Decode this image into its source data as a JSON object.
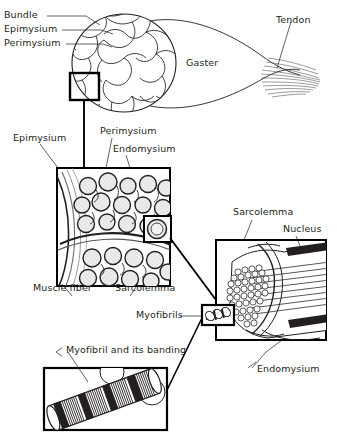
{
  "figure": {
    "domain": "anatomical-diagram",
    "stroke_color": "#231f20",
    "background_color": "#ffffff",
    "text_color": "#231f20"
  },
  "labels": {
    "bundle": "Bundle",
    "epimysium_top": "Epimysium",
    "perimysium_top": "Perimysium",
    "gaster": "Gaster",
    "tendon": "Tendon",
    "epimysium_mid": "Epimysium",
    "perimysium_mid": "Perimysium",
    "endomysium_mid": "Endomysium",
    "muscle_fiber": "Muscle fiber",
    "sarcolemma_mid": "Sarcolemma",
    "sarcolemma_right": "Sarcolemma",
    "nucleus": "Nucleus",
    "myofibrils": "Myofibrils",
    "endomysium_right": "Endomysium",
    "myofibril_banding": "Myofibril and its banding"
  },
  "panels": [
    {
      "id": "whole-muscle",
      "name": "whole-muscle-panel",
      "description": "Whole muscle belly with fascicle cross-section and tendon",
      "labels": [
        "Bundle",
        "Epimysium",
        "Perimysium",
        "Gaster",
        "Tendon"
      ]
    },
    {
      "id": "fascicle",
      "name": "fascicle-panel",
      "description": "Magnified fascicle showing muscle fibers in connective tissue",
      "labels": [
        "Epimysium",
        "Perimysium",
        "Endomysium",
        "Muscle fiber",
        "Sarcolemma"
      ]
    },
    {
      "id": "muscle-fiber",
      "name": "muscle-fiber-panel",
      "description": "Single muscle fiber with myofibrils, sarcolemma and nucleus",
      "labels": [
        "Sarcolemma",
        "Nucleus",
        "Myofibrils",
        "Endomysium"
      ]
    },
    {
      "id": "myofibril",
      "name": "myofibril-panel",
      "description": "Single myofibril showing striated banding pattern",
      "labels": [
        "Myofibril and its banding"
      ]
    }
  ]
}
